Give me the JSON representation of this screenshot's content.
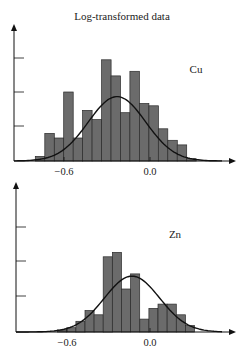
{
  "title": "Log-transformed data",
  "colors": {
    "bar": "#6b6b6b",
    "bar_stroke": "#2a2a2a",
    "curve": "#111111",
    "axis": "#111111"
  },
  "chart_data": [
    {
      "type": "bar",
      "label": "Cu",
      "title": "Log-transformed data",
      "xlabel": "",
      "ylabel": "",
      "x_ticks": [
        "-0.6",
        "0.0"
      ],
      "x_tick_values": [
        -0.6,
        0.0
      ],
      "y_ticks_unlabeled": 3,
      "bin_width": 0.066,
      "bin_starts": [
        -0.8,
        -0.734,
        -0.668,
        -0.602,
        -0.536,
        -0.47,
        -0.404,
        -0.338,
        -0.272,
        -0.206,
        -0.14,
        -0.074,
        -0.008,
        0.058,
        0.124,
        0.19,
        0.256
      ],
      "values": [
        2,
        12,
        10,
        30,
        10,
        22,
        18,
        44,
        37,
        21,
        39,
        25,
        24,
        14,
        9,
        7,
        1
      ],
      "overlay": {
        "type": "normal_curve",
        "mean": -0.23,
        "peak": 28
      }
    },
    {
      "type": "bar",
      "label": "Zn",
      "xlabel": "",
      "ylabel": "",
      "x_ticks": [
        "-0.6",
        "0.0"
      ],
      "x_tick_values": [
        -0.6,
        0.0
      ],
      "y_ticks_unlabeled": 3,
      "bin_width": 0.066,
      "bin_starts": [
        -0.668,
        -0.602,
        -0.536,
        -0.47,
        -0.404,
        -0.338,
        -0.272,
        -0.206,
        -0.14,
        -0.074,
        -0.008,
        0.058,
        0.124,
        0.19
      ],
      "values": [
        1,
        2,
        5,
        10,
        8,
        35,
        37,
        20,
        27,
        6,
        11,
        13,
        13,
        8,
        3
      ],
      "overlay": {
        "type": "normal_curve",
        "mean": -0.13,
        "peak": 26
      }
    }
  ]
}
